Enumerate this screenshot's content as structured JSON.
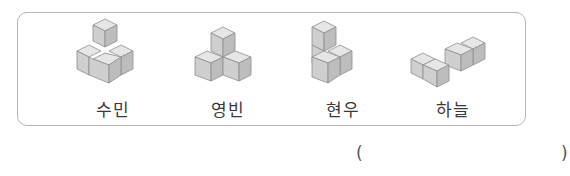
{
  "figures": [
    {
      "name": "수민",
      "cubes": 4,
      "shape": "3 cubes in L-base with 1 stacked on back"
    },
    {
      "name": "영빈",
      "cubes": 3,
      "shape": "2 cubes on base with 1 stacked on top between them"
    },
    {
      "name": "현우",
      "cubes": 4,
      "shape": "2-high column with 2 cubes in front row"
    },
    {
      "name": "하늘",
      "cubes": 4,
      "shape": "4 cubes flat in L/zigzag row"
    }
  ],
  "answer": {
    "open_paren": "(",
    "close_paren": ")",
    "value": ""
  }
}
